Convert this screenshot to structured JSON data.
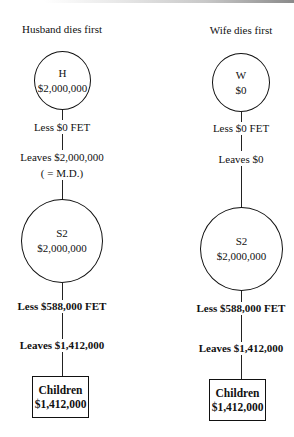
{
  "diagram": {
    "type": "flow",
    "left": {
      "title": "Husband dies first",
      "first_node": {
        "label": "H",
        "value": "$2,000,000"
      },
      "step1_tax": "Less $0 FET",
      "step1_leaves": "Leaves $2,000,000",
      "step1_note": "( = M.D.)",
      "second_node": {
        "label": "S2",
        "value": "$2,000,000"
      },
      "step2_tax": "Less $588,000 FET",
      "step2_leaves": "Leaves $1,412,000",
      "final_node": {
        "label": "Children",
        "value": "$1,412,000"
      }
    },
    "right": {
      "title": "Wife dies first",
      "first_node": {
        "label": "W",
        "value": "$0"
      },
      "step1_tax": "Less $0 FET",
      "step1_leaves": "Leaves $0",
      "second_node": {
        "label": "S2",
        "value": "$2,000,000"
      },
      "step2_tax": "Less $588,000 FET",
      "step2_leaves": "Leaves $1,412,000",
      "final_node": {
        "label": "Children",
        "value": "$1,412,000"
      }
    }
  }
}
